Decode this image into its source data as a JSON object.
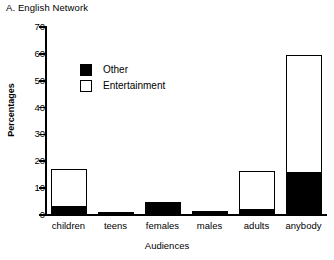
{
  "chart_data": {
    "type": "bar",
    "title": "A. English Network",
    "subtitle": "",
    "xlabel": "Audiences",
    "ylabel": "Percentages",
    "categories": [
      "children",
      "teens",
      "females",
      "males",
      "adults",
      "anybody"
    ],
    "series": [
      {
        "name": "Other",
        "color": "#000000",
        "values": [
          3,
          1,
          4,
          1.5,
          2,
          15.5
        ]
      },
      {
        "name": "Entertainment",
        "color": "#ffffff",
        "values": [
          14,
          0,
          0.5,
          0,
          14.5,
          44
        ]
      }
    ],
    "totals": [
      17,
      1,
      4.5,
      1.5,
      16.5,
      59.5
    ],
    "stacked": true,
    "ylim": [
      0,
      70
    ],
    "yticks": [
      0,
      10,
      20,
      30,
      40,
      50,
      60,
      70
    ],
    "ytick_labels": [
      "0",
      "10",
      "20",
      "30",
      "40",
      "50",
      "60",
      "70"
    ],
    "grid": false,
    "legend_position": "upper-left-inside",
    "legend_entries": [
      "Other",
      "Entertainment"
    ],
    "axis_color": "#000000",
    "background": "#ffffff"
  }
}
